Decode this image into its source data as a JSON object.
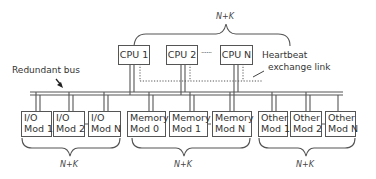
{
  "diagram": {
    "top_group": {
      "label": "N+K",
      "cpus": [
        {
          "label": "CPU 1"
        },
        {
          "label": "CPU 2"
        },
        {
          "label": "CPU N"
        }
      ],
      "ellipsis": "......"
    },
    "heartbeat_label_line1": "Heartbeat",
    "heartbeat_label_line2": "exchange link",
    "bus_label": "Redundant bus",
    "bottom_groups": [
      {
        "name": "io",
        "label": "N+K",
        "modules": [
          {
            "line1": "I/O",
            "line2": "Mod 1"
          },
          {
            "line1": "I/O",
            "line2": "Mod 2"
          },
          {
            "line1": "I/O",
            "line2": "Mod N"
          }
        ]
      },
      {
        "name": "memory",
        "label": "N+K",
        "modules": [
          {
            "line1": "Memory",
            "line2": "Mod 0"
          },
          {
            "line1": "Memory",
            "line2": "Mod 1"
          },
          {
            "line1": "Memory",
            "line2": "Mod N"
          }
        ]
      },
      {
        "name": "other",
        "label": "N+K",
        "modules": [
          {
            "line1": "Other",
            "line2": "Mod 1"
          },
          {
            "line1": "Other",
            "line2": "Mod 2"
          },
          {
            "line1": "Other",
            "line2": "Mod N"
          }
        ]
      }
    ],
    "colors": {
      "line": "#555555",
      "text": "#333333",
      "background": "#ffffff"
    }
  }
}
